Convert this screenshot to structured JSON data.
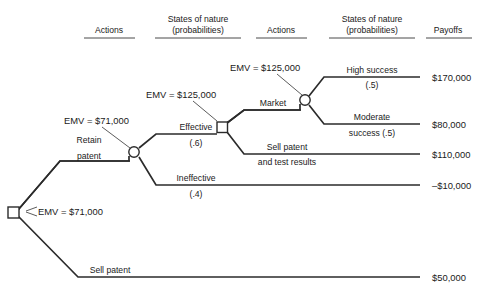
{
  "diagram": {
    "type": "decision-tree"
  },
  "headers": [
    {
      "line1": "Actions",
      "line2": ""
    },
    {
      "line1": "States of nature",
      "line2": "(probabilities)"
    },
    {
      "line1": "Actions",
      "line2": ""
    },
    {
      "line1": "States of nature",
      "line2": "(probabilities)"
    },
    {
      "line1": "Payoffs",
      "line2": ""
    }
  ],
  "emv": {
    "root": "EMV = $71,000",
    "retain_chance": "EMV = $71,000",
    "effective_decision": "EMV = $125,000",
    "market_chance": "EMV = $125,000"
  },
  "branches": {
    "retain_patent_line1": "Retain",
    "retain_patent_line2": "patent",
    "sell_patent": "Sell patent",
    "effective_line1": "Effective",
    "effective_line2": "(.6)",
    "ineffective_line1": "Ineffective",
    "ineffective_line2": "(.4)",
    "market": "Market",
    "sell_patent_test_line1": "Sell patent",
    "sell_patent_test_line2": "and test results",
    "high_success_line1": "High success",
    "high_success_line2": "(.5)",
    "moderate_success_line1": "Moderate",
    "moderate_success_line2": "success (.5)"
  },
  "payoffs": {
    "high_success": "$170,000",
    "moderate_success": "$80,000",
    "sell_patent_test": "$110,000",
    "ineffective": "–$10,000",
    "sell_patent": "$50,000"
  },
  "colors": {
    "line": "#2b2b2b",
    "text": "#1a1a1a",
    "rule": "#4a4a4a",
    "background": "#ffffff"
  }
}
